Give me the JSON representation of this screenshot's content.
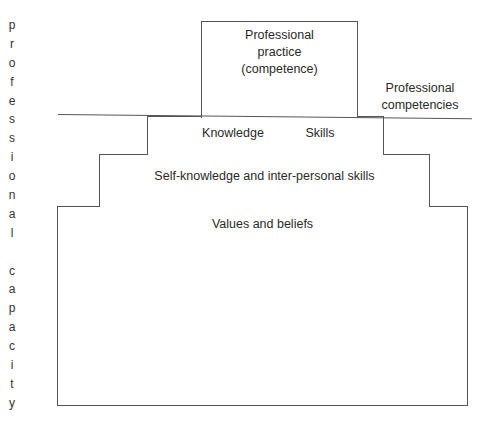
{
  "diagram": {
    "side_label_letters": [
      "p",
      "r",
      "o",
      "f",
      "e",
      "s",
      "s",
      "i",
      "o",
      "n",
      "a",
      "l",
      " ",
      "c",
      "a",
      "p",
      "a",
      "c",
      "i",
      "t",
      "y"
    ],
    "side_label": "professional capacity",
    "top_box": {
      "line1": "Professional",
      "line2": "practice",
      "line3": "(competence)"
    },
    "competencies_label": {
      "line1": "Professional",
      "line2": "competencies"
    },
    "knowledge_box": {
      "left": "Knowledge",
      "right": "Skills"
    },
    "self_box": {
      "label": "Self-knowledge and inter-personal skills"
    },
    "values_box": {
      "label": "Values and beliefs"
    }
  }
}
